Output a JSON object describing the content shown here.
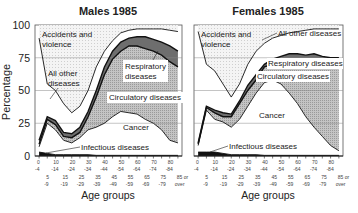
{
  "ylabel": "Percentage",
  "xlabel": "Age groups",
  "yticks": [
    "0",
    "25",
    "50",
    "75",
    "100"
  ],
  "xticks_top": [
    "0\n-4",
    "10\n-14",
    "20\n-24",
    "30\n-34",
    "40\n-44",
    "50\n-54",
    "60\n-64",
    "70\n-74",
    "80\n-84"
  ],
  "xticks_top_labels": [
    "0",
    "10",
    "20",
    "30",
    "40",
    "50",
    "60",
    "70",
    "80"
  ],
  "xticks_top_ends": [
    "-4",
    "-14",
    "-24",
    "-34",
    "-44",
    "-54",
    "-64",
    "-74",
    "-84"
  ],
  "xticks_bot_labels": [
    "5",
    "15",
    "25",
    "35",
    "45",
    "55",
    "65",
    "75",
    "85 or"
  ],
  "xticks_bot_ends": [
    "-9",
    "-19",
    "-29",
    "-39",
    "-49",
    "-59",
    "-69",
    "-79",
    "over"
  ],
  "colors": {
    "infectious": "#111111",
    "cancer": "#ffffff",
    "circulatory": "#bdbdbd",
    "respiratory": "#6e6e6e",
    "other": "#ffffff",
    "accidents": "#eeeeee",
    "line": "#111111",
    "grid": "#888888"
  },
  "chart_data": [
    {
      "type": "area",
      "title": "Males 1985",
      "xlabel": "Age groups",
      "ylabel": "Percentage",
      "ylim": [
        0,
        100
      ],
      "grid": true,
      "categories": [
        "0-4",
        "5-9",
        "10-14",
        "15-19",
        "20-24",
        "25-29",
        "30-34",
        "35-39",
        "40-44",
        "45-49",
        "50-54",
        "55-59",
        "60-64",
        "65-69",
        "70-74",
        "75-79",
        "80-84",
        "85 or over"
      ],
      "stacked_cumulative": true,
      "series": [
        {
          "name": "Infectious diseases",
          "values": [
            3,
            2,
            1,
            1,
            1,
            1,
            1,
            0.5,
            0.5,
            0.5,
            0.5,
            0.5,
            0.5,
            0.5,
            0.5,
            0.5,
            0.5,
            0.5
          ]
        },
        {
          "name": "Cancer",
          "values": [
            7,
            25,
            20,
            12,
            10,
            14,
            20,
            22,
            25,
            30,
            34,
            33,
            32,
            28,
            25,
            20,
            12,
            10
          ]
        },
        {
          "name": "Circulatory diseases",
          "values": [
            9,
            28,
            24,
            15,
            14,
            18,
            30,
            45,
            62,
            74,
            80,
            84,
            84,
            82,
            80,
            77,
            72,
            68
          ]
        },
        {
          "name": "Respiratory diseases",
          "values": [
            12,
            30,
            27,
            18,
            17,
            22,
            34,
            50,
            68,
            80,
            87,
            90,
            91,
            91,
            89,
            87,
            84,
            80
          ]
        },
        {
          "name": "All other diseases",
          "values": [
            90,
            55,
            50,
            40,
            33,
            38,
            50,
            68,
            80,
            88,
            94,
            96,
            97,
            97,
            97,
            97,
            96,
            95
          ]
        },
        {
          "name": "Accidents and violence",
          "values": [
            100,
            100,
            100,
            100,
            100,
            100,
            100,
            100,
            100,
            100,
            100,
            100,
            100,
            100,
            100,
            100,
            100,
            100
          ]
        }
      ],
      "annotations": [
        "Accidents and violence",
        "All other diseases",
        "Respiratory diseases",
        "Circulatory diseases",
        "Cancer",
        "Infectious diseases"
      ]
    },
    {
      "type": "area",
      "title": "Females 1985",
      "xlabel": "Age groups",
      "ylabel": "Percentage",
      "ylim": [
        0,
        100
      ],
      "grid": true,
      "categories": [
        "0-4",
        "5-9",
        "10-14",
        "15-19",
        "20-24",
        "25-29",
        "30-34",
        "35-39",
        "40-44",
        "45-49",
        "50-54",
        "55-59",
        "60-64",
        "65-69",
        "70-74",
        "75-79",
        "80-84",
        "85 or over"
      ],
      "stacked_cumulative": true,
      "series": [
        {
          "name": "Infectious diseases",
          "values": [
            3,
            3,
            3,
            2,
            1,
            1,
            1,
            1,
            0.5,
            0.5,
            0.5,
            0.5,
            0.5,
            0.5,
            0.5,
            0.5,
            0.5,
            0.5
          ]
        },
        {
          "name": "Cancer",
          "values": [
            8,
            35,
            28,
            26,
            22,
            28,
            38,
            48,
            56,
            58,
            55,
            48,
            40,
            30,
            22,
            15,
            8,
            4
          ]
        },
        {
          "name": "Circulatory diseases",
          "values": [
            9,
            37,
            33,
            30,
            30,
            40,
            50,
            58,
            68,
            70,
            72,
            74,
            73,
            74,
            73,
            73,
            72,
            72
          ]
        },
        {
          "name": "Respiratory diseases",
          "values": [
            10,
            38,
            35,
            33,
            32,
            42,
            54,
            62,
            70,
            74,
            76,
            78,
            78,
            77,
            78,
            76,
            75,
            75
          ]
        },
        {
          "name": "All other diseases",
          "values": [
            95,
            70,
            65,
            55,
            45,
            55,
            70,
            80,
            86,
            90,
            92,
            94,
            95,
            96,
            97,
            97,
            97,
            97
          ]
        },
        {
          "name": "Accidents and violence",
          "values": [
            100,
            100,
            100,
            100,
            100,
            100,
            100,
            100,
            100,
            100,
            100,
            100,
            100,
            100,
            100,
            100,
            100,
            100
          ]
        }
      ],
      "annotations": [
        "Accidents and violence",
        "All other diseases",
        "Respiratory diseases",
        "Circulatory diseases",
        "Cancer",
        "Infectious diseases"
      ]
    }
  ],
  "panels": [
    {
      "title": "Males 1985",
      "labels": {
        "accidents1": "Accidents and",
        "accidents2": "violence",
        "other1": "All other",
        "other2": "diseases",
        "resp1": "Respiratory",
        "resp2": "diseases",
        "circ": "Circulatory diseases",
        "cancer": "Cancer",
        "infectious": "Infectious diseases"
      }
    },
    {
      "title": "Females 1985",
      "labels": {
        "accidents1": "Accidents and",
        "accidents2": "violence",
        "other": "All other diseases",
        "resp": "Respiratory diseases",
        "circ": "Circulatory diseases",
        "cancer": "Cancer",
        "infectious": "Infectious diseases"
      }
    }
  ]
}
